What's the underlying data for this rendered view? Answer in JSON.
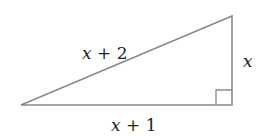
{
  "diagram": {
    "type": "right-triangle",
    "stroke_color": "#8a8a8a",
    "labels": {
      "hypotenuse": {
        "var": "x",
        "rest": " + 2"
      },
      "vertical_leg": {
        "var": "x",
        "rest": ""
      },
      "horizontal_leg": {
        "var": "x",
        "rest": " + 1"
      }
    },
    "right_angle_marker": true
  }
}
